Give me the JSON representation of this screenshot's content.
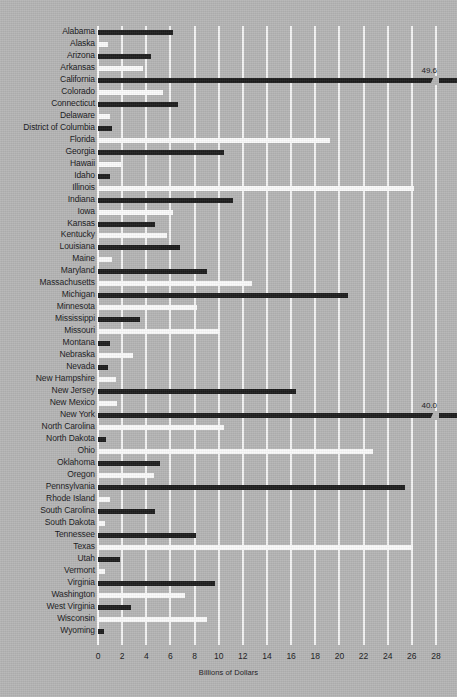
{
  "chart_data": {
    "type": "bar",
    "orientation": "horizontal",
    "title": "",
    "xlabel": "Billions of Dollars",
    "ylabel": "",
    "xlim": [
      0,
      28
    ],
    "xticks": [
      0,
      2,
      4,
      6,
      8,
      10,
      12,
      14,
      16,
      18,
      20,
      22,
      24,
      26,
      28
    ],
    "grid": true,
    "legend": "none",
    "bar_colors": {
      "dark": "#1d1d1d",
      "light": "#fbfbfb"
    },
    "background_color": "#b5b5b5",
    "note": "Bars alternate dark and light by row; two bars exceed the axis and are drawn with an axis break and a printed value.",
    "categories": [
      "Alabama",
      "Alaska",
      "Arizona",
      "Arkansas",
      "California",
      "Colorado",
      "Connecticut",
      "Delaware",
      "District of Columbia",
      "Florida",
      "Georgia",
      "Hawaii",
      "Idaho",
      "Illinois",
      "Indiana",
      "Iowa",
      "Kansas",
      "Kentucky",
      "Louisiana",
      "Maine",
      "Maryland",
      "Massachusetts",
      "Michigan",
      "Minnesota",
      "Mississippi",
      "Missouri",
      "Montana",
      "Nebraska",
      "Nevada",
      "New Hampshire",
      "New Jersey",
      "New Mexico",
      "New York",
      "North Carolina",
      "North Dakota",
      "Ohio",
      "Oklahoma",
      "Oregon",
      "Pennsylvania",
      "Rhode Island",
      "South Carolina",
      "South Dakota",
      "Tennessee",
      "Texas",
      "Utah",
      "Vermont",
      "Virginia",
      "Washington",
      "West Virginia",
      "Wisconsin",
      "Wyoming"
    ],
    "values": [
      6.2,
      0.8,
      4.4,
      3.7,
      49.6,
      5.4,
      6.6,
      1.0,
      1.2,
      19.2,
      10.4,
      1.9,
      1.0,
      26.2,
      11.2,
      6.2,
      4.7,
      5.7,
      6.8,
      1.2,
      9.0,
      12.8,
      20.7,
      8.2,
      3.5,
      10.1,
      1.0,
      2.9,
      0.8,
      1.5,
      16.4,
      1.6,
      40.0,
      10.4,
      0.7,
      22.8,
      5.1,
      4.6,
      25.4,
      1.0,
      4.7,
      0.6,
      8.1,
      26.1,
      1.8,
      0.6,
      9.7,
      7.2,
      2.7,
      9.0,
      0.5
    ],
    "annotations": [
      {
        "label": "49.6",
        "category": "California"
      },
      {
        "label": "40.0",
        "category": "New York"
      }
    ]
  }
}
